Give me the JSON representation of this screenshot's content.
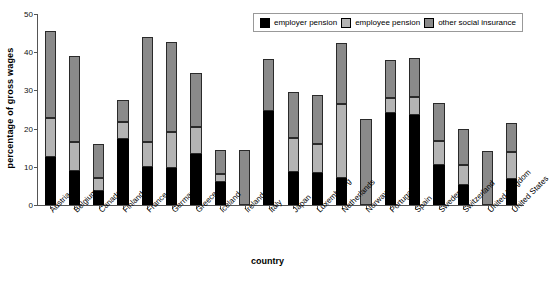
{
  "chart_data": {
    "type": "bar",
    "stacked": true,
    "title": "",
    "xlabel": "country",
    "ylabel": "percentage of gross wages",
    "ylim": [
      0,
      50
    ],
    "yticks": [
      0,
      10,
      20,
      30,
      40,
      50
    ],
    "grid": false,
    "legend_position": "top-right",
    "categories": [
      "Austria",
      "Belgium",
      "Canada",
      "Finland",
      "France",
      "Germany",
      "Greece",
      "Iceland",
      "Ireland",
      "Italy",
      "Japan",
      "Luxembourg",
      "Netherlands",
      "Norway",
      "Portugal",
      "Spain",
      "Sweden",
      "Switzerland",
      "United Kingdom",
      "United States"
    ],
    "series": [
      {
        "name": "employer pension",
        "color": "#000000",
        "values": [
          12.7,
          8.9,
          3.6,
          17.3,
          9.9,
          9.6,
          13.4,
          6.1,
          0.0,
          24.5,
          8.6,
          8.3,
          7.2,
          0.0,
          24.0,
          23.6,
          10.6,
          5.2,
          0.0,
          6.9
        ]
      },
      {
        "name": "employee pension",
        "color": "#b4b4b4",
        "values": [
          10.1,
          7.5,
          3.6,
          4.5,
          6.6,
          9.6,
          7.0,
          2.1,
          0.0,
          0.0,
          9.0,
          7.7,
          19.3,
          0.0,
          4.0,
          4.8,
          6.2,
          5.2,
          0.0,
          6.9
        ]
      },
      {
        "name": "other social insurance",
        "color": "#8a8a8a",
        "values": [
          22.7,
          22.7,
          8.8,
          5.8,
          27.5,
          23.5,
          14.2,
          6.2,
          14.4,
          13.8,
          11.9,
          12.9,
          16.0,
          22.4,
          10.0,
          10.2,
          9.8,
          9.4,
          14.2,
          7.6
        ]
      }
    ],
    "totals": [
      45.5,
      39.1,
      16.0,
      27.6,
      44.0,
      42.7,
      34.6,
      14.4,
      14.4,
      38.3,
      29.5,
      28.9,
      42.5,
      22.4,
      38.0,
      38.6,
      26.6,
      19.8,
      14.2,
      21.4
    ]
  },
  "legend": {
    "items": [
      {
        "label": "employer pension",
        "color": "#000000"
      },
      {
        "label": "employee pension",
        "color": "#b4b4b4"
      },
      {
        "label": "other social insurance",
        "color": "#8a8a8a"
      }
    ]
  }
}
